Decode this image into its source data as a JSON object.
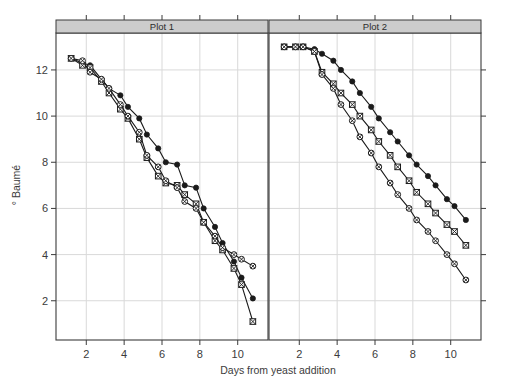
{
  "chart_data": {
    "type": "line",
    "title": "",
    "xlabel": "Days from yeast addition",
    "ylabel": "° Baumé",
    "xlim": [
      0.4,
      11.6
    ],
    "ylim": [
      0.3,
      13.6
    ],
    "xticks": [
      2,
      4,
      6,
      8,
      10
    ],
    "yticks": [
      2,
      4,
      6,
      8,
      10,
      12
    ],
    "grid": true,
    "legend_position": "none",
    "panel_layout": "1x2 trellis panels with top strip labels",
    "panels": [
      {
        "label": "Plot 1",
        "series": [
          {
            "name": "series-1",
            "marker": "filled-circle",
            "x": [
              1.2,
              1.8,
              2.2,
              2.8,
              3.2,
              3.8,
              4.2,
              4.8,
              5.2,
              5.8,
              6.2,
              6.8,
              7.2,
              7.8,
              8.2,
              8.8,
              9.2,
              9.8,
              10.2,
              10.8
            ],
            "y": [
              12.5,
              12.3,
              12.2,
              11.6,
              11.2,
              10.9,
              10.4,
              9.9,
              9.2,
              8.6,
              8.0,
              7.9,
              7.0,
              6.9,
              6.0,
              5.2,
              4.5,
              3.7,
              3.0,
              2.1
            ]
          },
          {
            "name": "series-2",
            "marker": "crossed-square",
            "x": [
              1.2,
              1.8,
              2.2,
              2.8,
              3.2,
              3.8,
              4.2,
              4.8,
              5.2,
              5.8,
              6.2,
              6.8,
              7.2,
              7.8,
              8.2,
              8.8,
              9.2,
              9.8,
              10.2,
              10.8
            ],
            "y": [
              12.5,
              12.2,
              12.1,
              11.5,
              11.0,
              10.3,
              9.9,
              9.0,
              8.2,
              7.4,
              7.1,
              7.0,
              6.6,
              6.2,
              5.4,
              4.6,
              4.2,
              3.4,
              2.7,
              1.1
            ]
          },
          {
            "name": "series-3",
            "marker": "crossed-circle",
            "x": [
              1.2,
              1.8,
              2.2,
              2.8,
              3.2,
              3.8,
              4.2,
              4.8,
              5.2,
              5.8,
              6.2,
              6.8,
              7.2,
              7.8,
              8.2,
              8.8,
              9.2,
              9.8,
              10.2,
              10.8
            ],
            "y": [
              12.5,
              12.4,
              11.9,
              11.6,
              11.2,
              10.5,
              10.0,
              9.3,
              8.3,
              7.8,
              7.2,
              6.9,
              6.3,
              6.0,
              5.4,
              4.8,
              4.3,
              4.0,
              3.8,
              3.5
            ]
          }
        ]
      },
      {
        "label": "Plot 2",
        "series": [
          {
            "name": "series-1",
            "marker": "filled-circle",
            "x": [
              1.2,
              1.8,
              2.2,
              2.8,
              3.2,
              3.8,
              4.2,
              4.8,
              5.2,
              5.8,
              6.2,
              6.8,
              7.2,
              7.8,
              8.2,
              8.8,
              9.2,
              9.8,
              10.2,
              10.8
            ],
            "y": [
              13.0,
              13.0,
              13.0,
              12.9,
              12.7,
              12.4,
              12.0,
              11.5,
              11.0,
              10.4,
              9.9,
              9.3,
              8.9,
              8.3,
              7.9,
              7.4,
              7.0,
              6.4,
              6.1,
              5.5
            ]
          },
          {
            "name": "series-2",
            "marker": "crossed-square",
            "x": [
              1.2,
              1.8,
              2.2,
              2.8,
              3.2,
              3.8,
              4.2,
              4.8,
              5.2,
              5.8,
              6.2,
              6.8,
              7.2,
              7.8,
              8.2,
              8.8,
              9.2,
              9.8,
              10.2,
              10.8
            ],
            "y": [
              13.0,
              13.0,
              13.0,
              12.8,
              11.9,
              11.4,
              11.0,
              10.5,
              10.0,
              9.4,
              8.9,
              8.3,
              7.8,
              7.2,
              6.7,
              6.2,
              5.8,
              5.3,
              5.0,
              4.4
            ]
          },
          {
            "name": "series-3",
            "marker": "crossed-circle",
            "x": [
              1.2,
              1.8,
              2.2,
              2.8,
              3.2,
              3.8,
              4.2,
              4.8,
              5.2,
              5.8,
              6.2,
              6.8,
              7.2,
              7.8,
              8.2,
              8.8,
              9.2,
              9.8,
              10.2,
              10.8
            ],
            "y": [
              13.0,
              13.0,
              13.0,
              12.8,
              11.8,
              11.2,
              10.5,
              9.8,
              9.1,
              8.4,
              7.8,
              7.1,
              6.6,
              6.0,
              5.5,
              5.0,
              4.6,
              4.0,
              3.6,
              2.9
            ]
          }
        ]
      }
    ],
    "colors": {
      "line": "#1a1a1a",
      "marker_fill": "#1a1a1a",
      "marker_open_fill": "#ffffff",
      "grid": "#d9d9d9",
      "axis": "#3b3b3b",
      "strip_background": "#cccccc",
      "background": "#ffffff"
    }
  }
}
